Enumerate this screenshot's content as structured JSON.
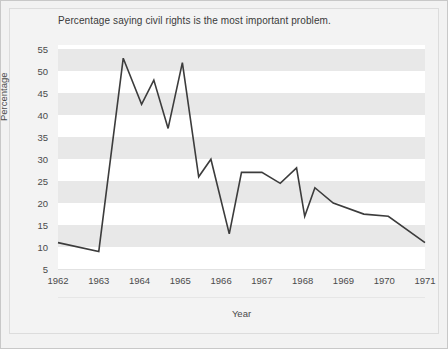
{
  "figure": {
    "title": "Percentage saying civil rights is the most important problem.",
    "background_color": "#f2f2f2",
    "band_color": "#e8e8e8",
    "plot_background": "#ffffff",
    "line_color": "#3c3c3c"
  },
  "chart_data": {
    "type": "line",
    "title": "Percentage saying civil rights is the most important problem.",
    "xlabel": "Year",
    "ylabel": "Percentage",
    "xlim": [
      1962,
      1971
    ],
    "ylim": [
      5,
      56
    ],
    "yticks": [
      5,
      10,
      15,
      20,
      25,
      30,
      35,
      40,
      45,
      50,
      55
    ],
    "xticks": [
      1962,
      1963,
      1964,
      1965,
      1966,
      1967,
      1968,
      1969,
      1970,
      1971
    ],
    "grid": "horizontal-bands",
    "legend": "none",
    "series": [
      {
        "name": "Civil rights most important problem",
        "x": [
          1962.0,
          1963.0,
          1963.6,
          1964.05,
          1964.35,
          1964.7,
          1965.05,
          1965.45,
          1965.75,
          1966.2,
          1966.5,
          1967.0,
          1967.45,
          1967.85,
          1968.05,
          1968.3,
          1968.75,
          1969.5,
          1970.1,
          1971.0
        ],
        "values": [
          11,
          9,
          53,
          42.5,
          48,
          37,
          52,
          26,
          30,
          13,
          27,
          27,
          24.5,
          28,
          17,
          23.5,
          20,
          17.5,
          17,
          11
        ]
      }
    ]
  },
  "axes": {
    "y_title": "Percentage",
    "x_title": "Year",
    "y_tick_labels": [
      "55",
      "50",
      "45",
      "40",
      "35",
      "30",
      "25",
      "20",
      "15",
      "10",
      "5"
    ],
    "x_tick_labels": [
      "1962",
      "1963",
      "1964",
      "1965",
      "1966",
      "1967",
      "1968",
      "1969",
      "1970",
      "1971"
    ]
  }
}
